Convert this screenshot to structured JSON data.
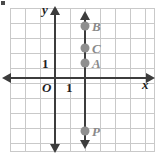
{
  "figure": {
    "type": "coordinate-plane",
    "axis_labels": {
      "x": "x",
      "y": "y",
      "origin": "O"
    },
    "tick_labels": {
      "x_one": "1",
      "y_one": "1"
    },
    "colors": {
      "grid": "#c9c9c9",
      "axis": "#3c3c3c",
      "point": "#8f8f8f",
      "point_label": "#8a8a8a",
      "background": "#ffffff"
    }
  },
  "chart_data": {
    "type": "scatter",
    "title": "",
    "xlabel": "x",
    "ylabel": "y",
    "xlim": [
      -3,
      6.5
    ],
    "ylim": [
      -4.5,
      4.5
    ],
    "grid": true,
    "legend": "none",
    "annotations": [
      {
        "name": "vertical-line",
        "description": "vertical line x = 2 with arrowheads at both ends",
        "x": 2,
        "y_start": -4.2,
        "y_end": 4.2
      }
    ],
    "points": [
      {
        "label": "B",
        "x": 2,
        "y": 3.5
      },
      {
        "label": "C",
        "x": 2,
        "y": 2
      },
      {
        "label": "A",
        "x": 2,
        "y": 1
      },
      {
        "label": "P",
        "x": 2,
        "y": -3.5
      }
    ]
  }
}
